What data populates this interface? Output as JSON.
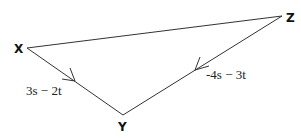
{
  "diagram": {
    "type": "vector-triangle",
    "vertices": [
      {
        "id": "X",
        "label": "X",
        "x": 27,
        "y": 48,
        "label_x": 14,
        "label_y": 52
      },
      {
        "id": "Y",
        "label": "Y",
        "x": 123,
        "y": 115,
        "label_x": 119,
        "label_y": 131
      },
      {
        "id": "Z",
        "label": "Z",
        "x": 282,
        "y": 16,
        "label_x": 286,
        "label_y": 22
      }
    ],
    "edges": [
      {
        "from": "X",
        "to": "Z",
        "label": ""
      },
      {
        "from": "X",
        "to": "Y",
        "label": "3s − 2t",
        "direction": "X→Y"
      },
      {
        "from": "Z",
        "to": "Y",
        "label": "-4s − 3t",
        "direction": "Z→Y"
      }
    ],
    "colors": {
      "line": "#333333",
      "text": "#111111",
      "background": "#ffffff"
    }
  }
}
